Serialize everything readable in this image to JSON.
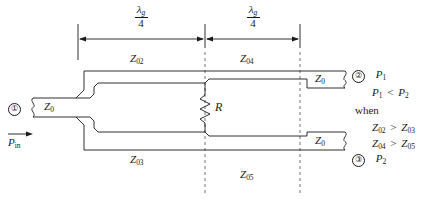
{
  "figure": {
    "type": "unequal-wilkinson-power-divider-schematic",
    "background_color": "#ffffff",
    "line_color": "#1a1a1a"
  },
  "dimensions": {
    "left_segment": {
      "numerator": "λ",
      "numerator_sub": "g",
      "denominator": "4"
    },
    "right_segment": {
      "numerator": "λ",
      "numerator_sub": "g",
      "denominator": "4"
    }
  },
  "ports": {
    "input": {
      "marker": "①",
      "impedance": "Z",
      "impedance_sub": "0",
      "power_label": "P",
      "power_sub": "in"
    },
    "output_top": {
      "marker": "②",
      "impedance": "Z",
      "impedance_sub": "0",
      "power_label": "P",
      "power_sub": "1"
    },
    "output_bottom": {
      "marker": "③",
      "impedance": "Z",
      "impedance_sub": "0",
      "power_label": "P",
      "power_sub": "2"
    }
  },
  "lines": {
    "top_left": {
      "symbol": "Z",
      "sub": "02"
    },
    "top_right": {
      "symbol": "Z",
      "sub": "04"
    },
    "bottom_left": {
      "symbol": "Z",
      "sub": "03"
    },
    "bottom_right": {
      "symbol": "Z",
      "sub": "05"
    }
  },
  "resistor": {
    "symbol": "R"
  },
  "conditions": {
    "inequality": {
      "left": "P",
      "left_sub": "1",
      "op": "<",
      "right": "P",
      "right_sub": "2"
    },
    "when_label": "when",
    "rules": [
      {
        "left": "Z",
        "left_sub": "02",
        "op": ">",
        "right": "Z",
        "right_sub": "03"
      },
      {
        "left": "Z",
        "left_sub": "04",
        "op": ">",
        "right": "Z",
        "right_sub": "05"
      }
    ]
  }
}
